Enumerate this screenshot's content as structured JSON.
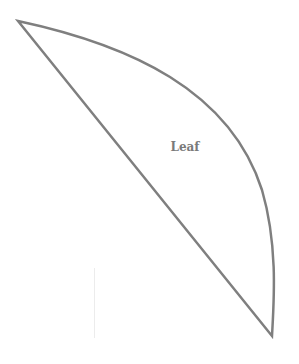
{
  "diagram": {
    "shape": "leaf",
    "label": "Leaf",
    "stroke_color": "#7f7f7f",
    "text_color": "#7a7a7a",
    "background": "#ffffff"
  }
}
